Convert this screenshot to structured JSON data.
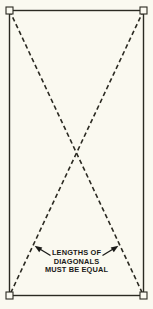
{
  "figure": {
    "name": "diagonal-equality-check-diagram",
    "background_color": "#faf9f0",
    "ink_color": "#2b2a22",
    "text_color": "#1a1a18"
  },
  "rectangle": {
    "name": "frame-rectangle",
    "left": 9.5,
    "top": 10.5,
    "right": 143.5,
    "bottom": 295.5,
    "stroke_width": 1.4
  },
  "corner_markers": {
    "name": "corner-square-markers",
    "size": 7,
    "stroke_width": 1.1,
    "points": [
      {
        "label": "top-left",
        "x": 9.5,
        "y": 10.5
      },
      {
        "label": "top-right",
        "x": 143.5,
        "y": 10.5
      },
      {
        "label": "bottom-left",
        "x": 9.5,
        "y": 295.5
      },
      {
        "label": "bottom-right",
        "x": 143.5,
        "y": 295.5
      }
    ]
  },
  "diagonals": {
    "name": "dashed-diagonals",
    "stroke_width": 1.6,
    "dash_pattern": "4.5 3",
    "crossing_point": {
      "x": 76.5,
      "y": 153
    },
    "lines": [
      {
        "label": "diagonal-top-left-to-bottom-right",
        "x1": 9.5,
        "y1": 10.5,
        "x2": 143.5,
        "y2": 295.5
      },
      {
        "label": "diagonal-top-right-to-bottom-left",
        "x1": 143.5,
        "y1": 10.5,
        "x2": 9.5,
        "y2": 295.5
      }
    ]
  },
  "callout": {
    "name": "diagonals-equal-callout",
    "lines": [
      "LENGTHS OF",
      "DIAGONALS",
      "MUST BE EQUAL"
    ],
    "line_positions": [
      {
        "x": 76.5,
        "y": 255
      },
      {
        "x": 76.5,
        "y": 263.5
      },
      {
        "x": 76.5,
        "y": 272
      }
    ],
    "arrows": [
      {
        "label": "left-arrow-to-diagonal",
        "direction": "up-left",
        "tail": {
          "x": 50.5,
          "y": 255.5
        },
        "tip": {
          "x": 35.5,
          "y": 246.5
        }
      },
      {
        "label": "right-arrow-to-diagonal",
        "direction": "up-right",
        "tail": {
          "x": 102.5,
          "y": 255.5
        },
        "tip": {
          "x": 117.5,
          "y": 246.5
        }
      }
    ]
  }
}
